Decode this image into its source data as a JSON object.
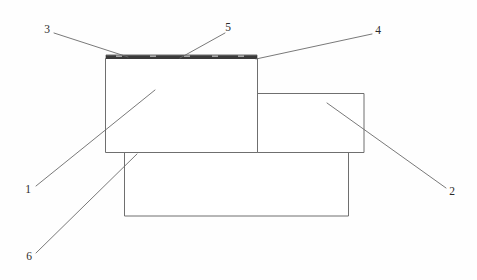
{
  "figure": {
    "type": "technical-cross-section-diagram",
    "background_color": "#fefefe",
    "outline_color": "#6f6f6f",
    "coating_color": "#3a3a3a",
    "leader_color": "#6a6a6a",
    "text_color": "#2b2b2b",
    "width": 477,
    "height": 280
  },
  "callouts": [
    {
      "id": "callout-1",
      "label": "1",
      "text_x": 28,
      "text_y": 190,
      "leader": [
        [
          36,
          186
        ],
        [
          155,
          90
        ]
      ],
      "target": "upper-left-body"
    },
    {
      "id": "callout-2",
      "label": "2",
      "text_x": 452,
      "text_y": 192,
      "leader": [
        [
          446,
          188
        ],
        [
          327,
          103
        ]
      ],
      "target": "right-step-body"
    },
    {
      "id": "callout-3",
      "label": "3",
      "text_x": 47,
      "text_y": 30,
      "leader": [
        [
          54,
          33
        ],
        [
          128,
          57
        ]
      ],
      "target": "coating-left-end"
    },
    {
      "id": "callout-4",
      "label": "4",
      "text_x": 378,
      "text_y": 31,
      "leader": [
        [
          372,
          34
        ],
        [
          256,
          59
        ]
      ],
      "target": "coating-right-end"
    },
    {
      "id": "callout-5",
      "label": "5",
      "text_x": 228,
      "text_y": 28,
      "leader": [
        [
          225,
          33
        ],
        [
          180,
          58
        ]
      ],
      "target": "coating-mid"
    },
    {
      "id": "callout-6",
      "label": "6",
      "text_x": 29,
      "text_y": 257,
      "leader": [
        [
          36,
          253
        ],
        [
          137,
          154
        ]
      ],
      "target": "lower-base-body"
    }
  ],
  "shapes": {
    "upper_left_block": {
      "name": "upper-left-block",
      "x": 105,
      "y": 58,
      "width": 152,
      "height": 94
    },
    "right_step_block": {
      "name": "right-step-block",
      "x": 257,
      "y": 93,
      "width": 107,
      "height": 59
    },
    "lower_base_block": {
      "name": "lower-base-block",
      "x": 124,
      "y": 152,
      "width": 224,
      "height": 64
    },
    "coating_layer": {
      "name": "coating-layer",
      "x": 106,
      "y": 55,
      "width": 151,
      "height": 3.4
    },
    "coating_ticks": [
      118,
      152,
      186,
      214,
      240
    ]
  }
}
